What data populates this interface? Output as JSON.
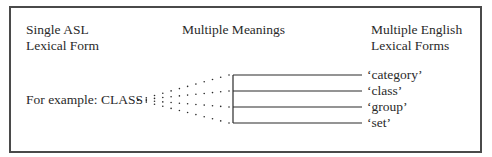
{
  "diagram": {
    "headers": {
      "left": [
        "Single ASL",
        "Lexical Form"
      ],
      "middle": "Multiple Meanings",
      "right": [
        "Multiple English",
        "Lexical Forms"
      ]
    },
    "example_label": "For example: CLASS",
    "english_forms": [
      "‘category’",
      "‘class’",
      "‘group’",
      "‘set’"
    ],
    "fan": {
      "style": "dotted lines radiating from the example word to each meaning line",
      "origin": [
        138,
        100
      ],
      "ray_ends": [
        [
          229,
          75
        ],
        [
          229,
          91
        ],
        [
          229,
          107
        ],
        [
          229,
          123
        ]
      ],
      "dot_spacing": 8,
      "note": "approximate reconstruction; dots in the source form a dense lattice between rays"
    },
    "bracket": {
      "x_start": 233,
      "x_end": 362,
      "line_y": [
        75,
        91,
        107,
        123
      ]
    },
    "colors": {
      "ink": "#2a2a2a",
      "frame": "#4a4a4a",
      "background": "#ffffff"
    }
  }
}
